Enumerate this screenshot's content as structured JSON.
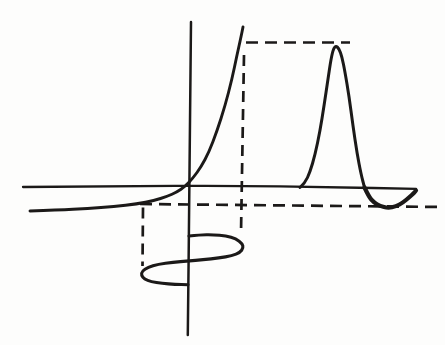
{
  "figure": {
    "canvas": {
      "width": 445,
      "height": 345,
      "background": "#fdfdfc"
    },
    "ink_color": "#1b1918",
    "axes": [
      {
        "name": "x-axis",
        "stroke_width": 2.3,
        "points": [
          [
            23,
            187
          ],
          [
            120,
            186.2
          ],
          [
            230,
            185.6
          ],
          [
            330,
            187.2
          ],
          [
            416,
            188.8
          ]
        ]
      },
      {
        "name": "y-axis",
        "stroke_width": 2.5,
        "points": [
          [
            191,
            22
          ],
          [
            189.5,
            180
          ],
          [
            187.8,
            335
          ]
        ]
      }
    ],
    "guide_lines": [
      {
        "name": "output-max-guide",
        "x1": 246,
        "y1": 42.5,
        "x2": 350,
        "y2": 42.5,
        "dash": "12 7",
        "stroke_width": 2.7
      },
      {
        "name": "input-max-guide",
        "x1": 244,
        "y1": 55,
        "x2": 241,
        "y2": 233,
        "dash": "11 7",
        "stroke_width": 2.7
      },
      {
        "name": "output-min-guide",
        "x1": 140,
        "y1": 204,
        "x2": 442,
        "y2": 207,
        "dash": "12 7",
        "stroke_width": 2.7
      },
      {
        "name": "input-min-guide",
        "x1": 143,
        "y1": 207.5,
        "x2": 142.5,
        "y2": 266,
        "dash": "11 7",
        "stroke_width": 2.7
      }
    ],
    "curves": [
      {
        "name": "exponential-transfer-curve",
        "stroke_width": 2.9,
        "points": [
          [
            30,
            211
          ],
          [
            58,
            210
          ],
          [
            88,
            208.5
          ],
          [
            114,
            206.5
          ],
          [
            137,
            204
          ],
          [
            154,
            200.5
          ],
          [
            167,
            196.5
          ],
          [
            177,
            192
          ],
          [
            185,
            186.5
          ],
          [
            193,
            178
          ],
          [
            201,
            167
          ],
          [
            209,
            152
          ],
          [
            217,
            131
          ],
          [
            225,
            106
          ],
          [
            232,
            79
          ],
          [
            237,
            55
          ],
          [
            241,
            37
          ],
          [
            243,
            27
          ]
        ]
      },
      {
        "name": "output-pulse-curve",
        "stroke_width": 3,
        "points": [
          [
            300,
            187.5
          ],
          [
            305,
            183
          ],
          [
            310,
            172
          ],
          [
            315,
            155
          ],
          [
            320,
            131
          ],
          [
            324,
            106
          ],
          [
            328,
            79
          ],
          [
            331,
            59
          ],
          [
            333.5,
            48.5
          ],
          [
            336,
            46
          ],
          [
            339,
            48.5
          ],
          [
            342,
            57
          ],
          [
            345,
            72
          ],
          [
            349,
            96
          ],
          [
            353,
            126
          ],
          [
            357,
            153
          ],
          [
            361,
            174
          ],
          [
            364.5,
            187.5
          ]
        ]
      },
      {
        "name": "output-undershoot-curve",
        "stroke_width": 4.2,
        "points": [
          [
            364.5,
            187.5
          ],
          [
            369,
            197
          ],
          [
            374,
            202.5
          ],
          [
            380,
            206
          ],
          [
            388,
            208
          ],
          [
            396,
            206.5
          ],
          [
            403,
            202.5
          ],
          [
            409,
            197.5
          ],
          [
            414,
            193
          ],
          [
            416,
            190.5
          ]
        ]
      },
      {
        "name": "input-sine-curve",
        "stroke_width": 3.1,
        "points": [
          [
            189,
            236
          ],
          [
            200,
            234.8
          ],
          [
            213,
            234.6
          ],
          [
            226,
            235.8
          ],
          [
            236,
            238.8
          ],
          [
            242.3,
            243.5
          ],
          [
            243.3,
            248
          ],
          [
            240,
            252.5
          ],
          [
            232,
            255.8
          ],
          [
            219,
            258
          ],
          [
            203,
            259.8
          ],
          [
            188,
            261
          ],
          [
            173,
            262.3
          ],
          [
            158,
            264.3
          ],
          [
            148,
            267.3
          ],
          [
            142,
            271.3
          ],
          [
            141.3,
            275.3
          ],
          [
            144.5,
            279
          ],
          [
            151,
            281.7
          ],
          [
            162,
            283.4
          ],
          [
            175,
            284.3
          ],
          [
            188,
            284.8
          ]
        ]
      }
    ]
  }
}
